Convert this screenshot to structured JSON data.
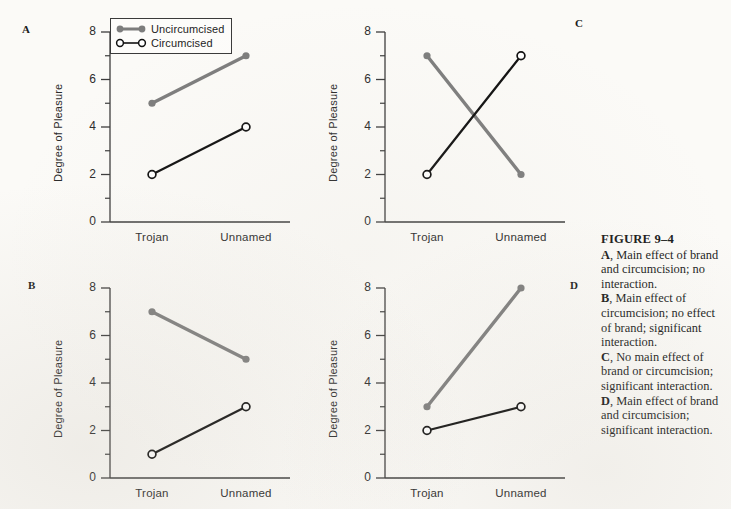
{
  "figure": {
    "title": "FIGURE 9–4",
    "caption_parts": [
      {
        "letter": "A",
        "text": ", Main effect of brand and circumcision; no interaction."
      },
      {
        "letter": "B",
        "text": ", Main effect of circumcision; no effect of brand; significant interaction."
      },
      {
        "letter": "C",
        "text": ", No main effect of brand or circumcision; significant interaction."
      },
      {
        "letter": "D",
        "text": ", Main effect of brand and circumcision; significant interaction."
      }
    ]
  },
  "legend": {
    "items": [
      {
        "label": "Uncircumcised",
        "marker": "filled-circle",
        "color": "#7d7d7d"
      },
      {
        "label": "Circumcised",
        "marker": "open-circle",
        "color": "#111111"
      }
    ]
  },
  "colors": {
    "uncircumcised": "#7d7d7d",
    "circumcised": "#111111",
    "axis": "#3c3c3c",
    "background": "#fbfaf7"
  },
  "chart_data": [
    {
      "type": "line",
      "panel": "A",
      "title": "",
      "xlabel": "",
      "ylabel": "Degree of Pleasure",
      "categories": [
        "Trojan",
        "Unnamed"
      ],
      "ylim": [
        0,
        8
      ],
      "yticks": [
        0,
        2,
        4,
        6,
        8
      ],
      "yticks_minor": [
        1,
        3,
        5,
        7
      ],
      "grid": false,
      "legend_position": "top-left-inside",
      "series": [
        {
          "name": "Uncircumcised",
          "values": [
            5,
            7
          ]
        },
        {
          "name": "Circumcised",
          "values": [
            2,
            4
          ]
        }
      ]
    },
    {
      "type": "line",
      "panel": "C",
      "title": "",
      "xlabel": "",
      "ylabel": "Degree of Pleasure",
      "categories": [
        "Trojan",
        "Unnamed"
      ],
      "ylim": [
        0,
        8
      ],
      "yticks": [
        0,
        2,
        4,
        6,
        8
      ],
      "yticks_minor": [
        1,
        3,
        5,
        7
      ],
      "grid": false,
      "legend_position": "none",
      "series": [
        {
          "name": "Uncircumcised",
          "values": [
            7,
            2
          ]
        },
        {
          "name": "Circumcised",
          "values": [
            2,
            7
          ]
        }
      ]
    },
    {
      "type": "line",
      "panel": "B",
      "title": "",
      "xlabel": "",
      "ylabel": "Degree of Pleasure",
      "categories": [
        "Trojan",
        "Unnamed"
      ],
      "ylim": [
        0,
        8
      ],
      "yticks": [
        0,
        2,
        4,
        6,
        8
      ],
      "yticks_minor": [
        1,
        3,
        5,
        7
      ],
      "grid": false,
      "legend_position": "none",
      "series": [
        {
          "name": "Uncircumcised",
          "values": [
            7,
            5
          ]
        },
        {
          "name": "Circumcised",
          "values": [
            1,
            3
          ]
        }
      ]
    },
    {
      "type": "line",
      "panel": "D",
      "title": "",
      "xlabel": "",
      "ylabel": "Degree of Pleasure",
      "categories": [
        "Trojan",
        "Unnamed"
      ],
      "ylim": [
        0,
        8
      ],
      "yticks": [
        0,
        2,
        4,
        6,
        8
      ],
      "yticks_minor": [
        1,
        3,
        5,
        7
      ],
      "grid": false,
      "legend_position": "none",
      "series": [
        {
          "name": "Uncircumcised",
          "values": [
            3,
            8
          ]
        },
        {
          "name": "Circumcised",
          "values": [
            2,
            3
          ]
        }
      ]
    }
  ]
}
